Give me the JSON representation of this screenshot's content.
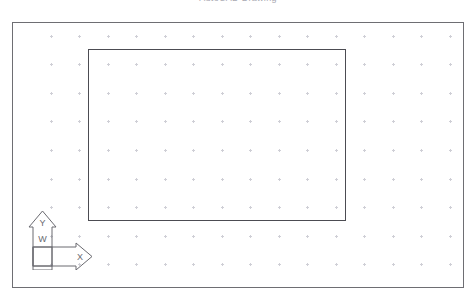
{
  "canvas": {
    "width": 476,
    "height": 303,
    "background_color": "#ffffff",
    "top_text_fragment": "AutoCAD Drawing"
  },
  "frame": {
    "label": "drawing-viewport-border",
    "x": 12,
    "y": 22,
    "width": 452,
    "height": 266,
    "stroke_color": "#6e6e73",
    "stroke_width": 1
  },
  "grid": {
    "visible": true,
    "marker_style": "plus",
    "color": "#cfcfd6",
    "spacing_x": 28.5,
    "spacing_y": 28.6,
    "origin_x": 50,
    "origin_y": 35,
    "columns": 15,
    "rows": 9
  },
  "shapes": [
    {
      "name": "rectangle",
      "type": "rectangle",
      "x": 87,
      "y": 48,
      "width": 258,
      "height": 172,
      "stroke_color": "#4c4c52",
      "stroke_width": 1,
      "fill": "none"
    }
  ],
  "ucs_icon": {
    "name": "coordinate-axis-indicator",
    "x": 28,
    "y": 209,
    "width": 66,
    "height": 61,
    "stroke_color": "#6a6a70",
    "axis_y_label": "Y",
    "axis_x_label": "X",
    "origin_box_label": "W"
  }
}
